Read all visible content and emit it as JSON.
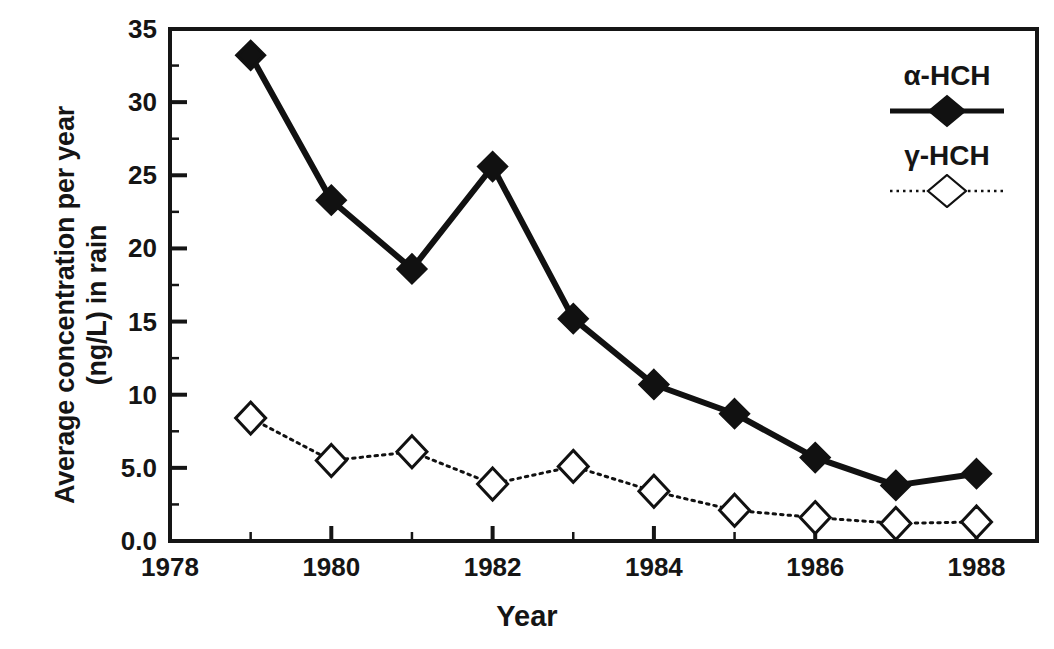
{
  "chart_data": {
    "type": "line",
    "title": "",
    "subtitle": "",
    "xlabel": "Year",
    "ylabel_line1": "Average concentration per year",
    "ylabel_line2": "(ng/L) in rain",
    "x": [
      1979,
      1980,
      1981,
      1982,
      1983,
      1984,
      1985,
      1986,
      1987,
      1988
    ],
    "xlim": [
      1978,
      1988.75
    ],
    "ylim": [
      0.0,
      35.0
    ],
    "xticks": [
      1978,
      1980,
      1982,
      1984,
      1986,
      1988
    ],
    "xtick_labels": [
      "1978",
      "1980",
      "1982",
      "1984",
      "1986",
      "1988"
    ],
    "xminorticks": [
      1979,
      1981,
      1983,
      1985,
      1987
    ],
    "yticks": [
      0.0,
      5.0,
      10,
      15,
      20,
      25,
      30,
      35
    ],
    "ytick_labels": [
      "0.0",
      "5.0",
      "10",
      "15",
      "20",
      "25",
      "30",
      "35"
    ],
    "yminorticks": [
      2.5,
      7.5,
      12.5,
      17.5,
      22.5,
      27.5,
      32.5
    ],
    "grid": false,
    "legend_position": "top-right-outside",
    "series": [
      {
        "name": "α-HCH",
        "marker": "filled-diamond",
        "line_style": "solid",
        "color": "#111111",
        "values": [
          33.2,
          23.3,
          18.6,
          25.6,
          15.2,
          10.7,
          8.7,
          5.7,
          3.8,
          4.6
        ]
      },
      {
        "name": "γ-HCH",
        "marker": "open-diamond",
        "line_style": "dotted",
        "color": "#111111",
        "values": [
          8.4,
          5.5,
          6.1,
          3.9,
          5.1,
          3.4,
          2.1,
          1.6,
          1.2,
          1.3
        ]
      }
    ]
  },
  "legend": {
    "entries": [
      {
        "label": "α-HCH",
        "marker": "filled-diamond",
        "line_style": "solid"
      },
      {
        "label": "γ-HCH",
        "marker": "open-diamond",
        "line_style": "dotted"
      }
    ]
  },
  "colors": {
    "axis": "#151515",
    "series_alpha": "#111111",
    "series_gamma": "#111111",
    "background": "#ffffff"
  }
}
